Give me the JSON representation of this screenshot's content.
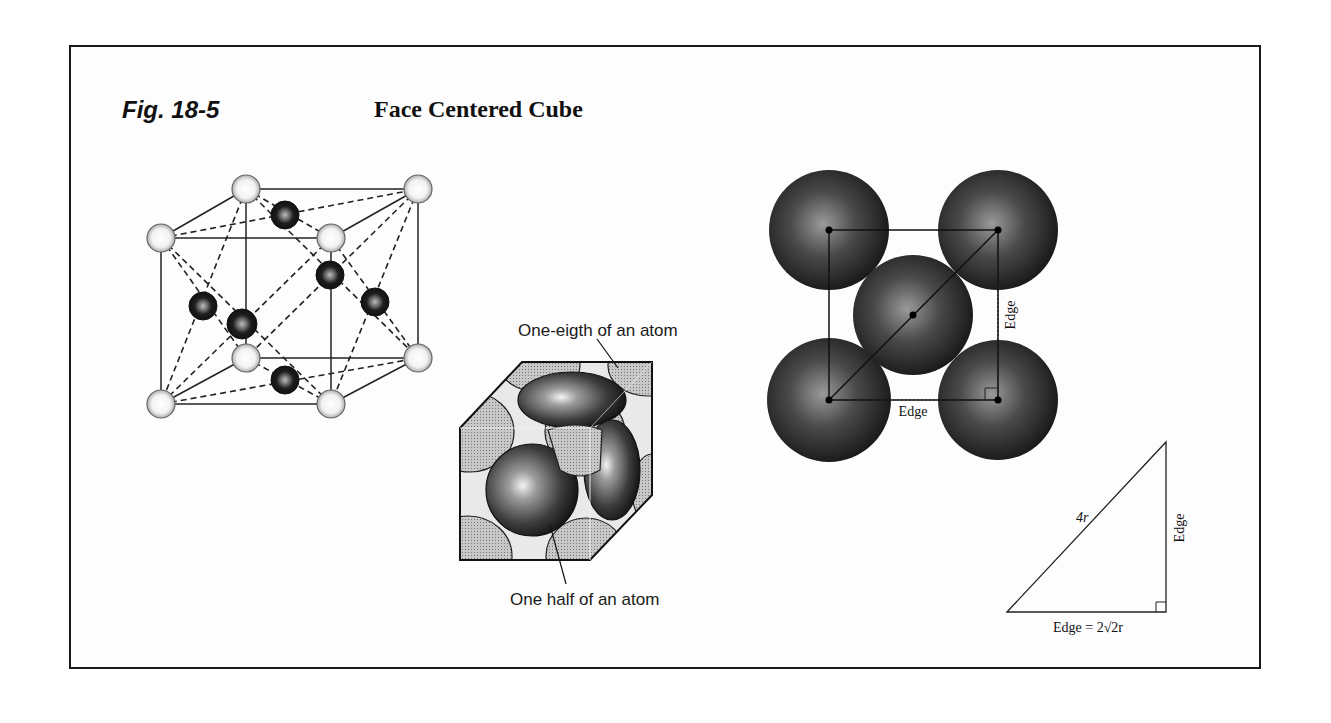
{
  "figure": {
    "label": "Fig. 18-5",
    "title": "Face Centered Cube"
  },
  "panels": {
    "lattice": {
      "description": "FCC unit cell ball-and-stick with corner atoms (light) and face-center atoms (dark)",
      "corner_atom_count": 8,
      "face_atom_count": 6
    },
    "space_filling": {
      "label_top": "One-eigth of an atom",
      "label_bottom": "One half of an atom"
    },
    "face_view": {
      "edge_label_bottom": "Edge",
      "edge_label_right": "Edge"
    },
    "triangle": {
      "hypotenuse_label": "4r",
      "vertical_label": "Edge",
      "base_label": "Edge = 2√2r"
    }
  },
  "colors": {
    "ink": "#111111",
    "light_atom": "#e4e4e4",
    "dark_atom": "#262626",
    "sphere_dark": "#3a3a3a"
  }
}
